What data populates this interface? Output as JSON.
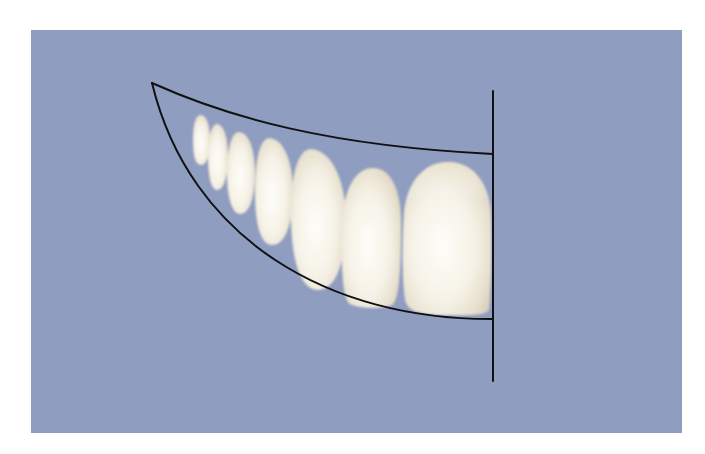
{
  "figure": {
    "type": "dental-illustration",
    "background_color": "#8f9dc1",
    "page_color": "#ffffff",
    "line_color": "#111111",
    "tooth_color_light": "#fbf9f2",
    "tooth_color_shade": "#ddd6c4"
  },
  "guides": {
    "upper_curve": {
      "start": [
        152,
        83
      ],
      "control": [
        300,
        145
      ],
      "end": [
        493,
        154
      ]
    },
    "lower_curve": {
      "start": [
        152,
        83
      ],
      "control1": [
        200,
        260
      ],
      "control2": [
        340,
        318
      ],
      "end": [
        493,
        319
      ]
    },
    "midline": {
      "x": 493,
      "y1": 91,
      "y2": 381
    }
  },
  "teeth": [
    {
      "name": "tooth-7",
      "cx": 201,
      "cy": 140,
      "rx": 8,
      "ry": 25
    },
    {
      "name": "tooth-6",
      "cx": 218,
      "cy": 157,
      "rx": 10,
      "ry": 33
    },
    {
      "name": "tooth-5",
      "cx": 241,
      "cy": 173,
      "rx": 13,
      "ry": 41
    },
    {
      "name": "tooth-4",
      "cx": 273,
      "cy": 192,
      "rx": 18,
      "ry": 54
    },
    {
      "name": "tooth-3",
      "cx": 318,
      "cy": 219,
      "rx": 27,
      "ry": 71
    },
    {
      "name": "tooth-2",
      "cx": 371,
      "cy": 238,
      "rx": 30,
      "ry": 70
    },
    {
      "name": "tooth-1",
      "cx": 446,
      "cy": 238,
      "rx": 45,
      "ry": 77
    }
  ]
}
